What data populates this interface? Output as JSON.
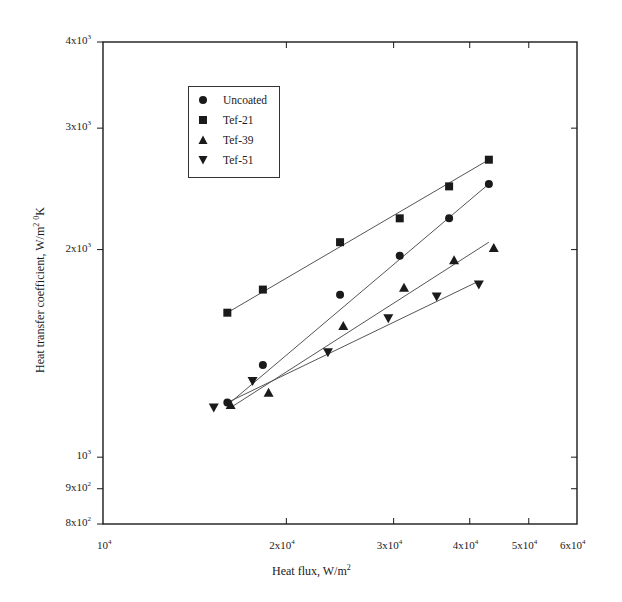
{
  "axes": {
    "x_title_main": "Heat flux, W/m",
    "x_title_sup": "2",
    "y_title_main": "Heat transfer coefficient, W/m",
    "y_title_sup1": "2",
    "y_title_sup2": "0",
    "y_title_end": "K",
    "x_ticks": [
      {
        "value": 10000,
        "base": "10",
        "exp": "4",
        "mult": ""
      },
      {
        "value": 20000,
        "base": "2x10",
        "exp": "4",
        "mult": "2"
      },
      {
        "value": 30000,
        "base": "3x10",
        "exp": "4",
        "mult": "3"
      },
      {
        "value": 40000,
        "base": "4x10",
        "exp": "4",
        "mult": "4"
      },
      {
        "value": 50000,
        "base": "5x10",
        "exp": "4",
        "mult": "5"
      },
      {
        "value": 60000,
        "base": "6x10",
        "exp": "4",
        "mult": "6"
      }
    ],
    "y_ticks": [
      {
        "value": 800,
        "base": "8x10",
        "exp": "2"
      },
      {
        "value": 900,
        "base": "9x10",
        "exp": "2"
      },
      {
        "value": 1000,
        "base": "10",
        "exp": "3"
      },
      {
        "value": 2000,
        "base": "2x10",
        "exp": "3"
      },
      {
        "value": 3000,
        "base": "3x10",
        "exp": "3"
      },
      {
        "value": 4000,
        "base": "4x10",
        "exp": "3"
      }
    ]
  },
  "legend": {
    "items": [
      {
        "label": "Uncoated",
        "marker": "circle"
      },
      {
        "label": "Tef-21",
        "marker": "square"
      },
      {
        "label": "Tef-39",
        "marker": "triangle-up"
      },
      {
        "label": "Tef-51",
        "marker": "triangle-down"
      }
    ]
  },
  "colors": {
    "ink": "#1a1a1a",
    "line": "#555555",
    "background": "#ffffff"
  },
  "chart_data": {
    "type": "scatter",
    "title": "",
    "xlabel": "Heat flux, W/m^2",
    "ylabel": "Heat transfer coefficient, W/m^2 0K",
    "xscale": "log",
    "yscale": "log",
    "xlim": [
      10000,
      60000
    ],
    "ylim": [
      800,
      4000
    ],
    "grid": false,
    "legend_position": "upper-left inside",
    "x_tick_labels": [
      "10^4",
      "2x10^4",
      "3x10^4",
      "4x10^4",
      "5x10^4",
      "6x10^4"
    ],
    "y_tick_labels": [
      "8x10^2",
      "9x10^2",
      "10^3",
      "2x10^3",
      "3x10^3",
      "4x10^3"
    ],
    "series": [
      {
        "name": "Uncoated",
        "marker": "circle",
        "x": [
          16000,
          18300,
          24500,
          30700,
          37000,
          43000
        ],
        "y": [
          1200,
          1360,
          1720,
          1960,
          2220,
          2490
        ],
        "fit_line": {
          "x": [
            16000,
            43000
          ],
          "y": [
            1190,
            2490
          ]
        }
      },
      {
        "name": "Tef-21",
        "marker": "square",
        "x": [
          16000,
          18300,
          24500,
          30700,
          37000,
          43000
        ],
        "y": [
          1620,
          1750,
          2050,
          2220,
          2470,
          2700
        ],
        "fit_line": {
          "x": [
            16000,
            43000
          ],
          "y": [
            1620,
            2700
          ]
        }
      },
      {
        "name": "Tef-39",
        "marker": "triangle-up",
        "x": [
          16200,
          18700,
          24800,
          31200,
          37700,
          43800
        ],
        "y": [
          1190,
          1240,
          1550,
          1760,
          1930,
          2010
        ],
        "fit_line": {
          "x": [
            16200,
            43000
          ],
          "y": [
            1180,
            2050
          ]
        }
      },
      {
        "name": "Tef-51",
        "marker": "triangle-down",
        "x": [
          15200,
          17600,
          23400,
          29400,
          35300,
          41400
        ],
        "y": [
          1180,
          1290,
          1420,
          1590,
          1710,
          1780
        ],
        "fit_line": {
          "x": [
            16000,
            41400
          ],
          "y": [
            1200,
            1800
          ]
        }
      }
    ]
  }
}
